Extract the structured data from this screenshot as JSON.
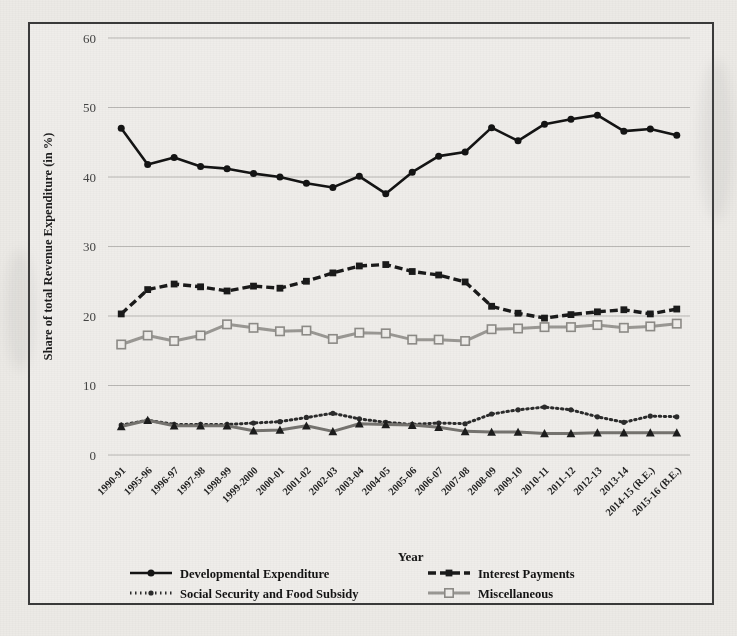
{
  "chart_data": {
    "type": "line",
    "title": "",
    "xlabel": "Year",
    "ylabel": "Share of total Revenue Expenditure (in %)",
    "ylim": [
      0,
      60
    ],
    "yticks": [
      0,
      10,
      20,
      30,
      40,
      50,
      60
    ],
    "grid": true,
    "legend_position": "bottom",
    "categories": [
      "1990-91",
      "1995-96",
      "1996-97",
      "1997-98",
      "1998-99",
      "1999-2000",
      "2000-01",
      "2001-02",
      "2002-03",
      "2003-04",
      "2004-05",
      "2005-06",
      "2006-07",
      "2007-08",
      "2008-09",
      "2009-10",
      "2010-11",
      "2011-12",
      "2012-13",
      "2013-14",
      "2014-15 (R.E.)",
      "2015-16 (B.E.)"
    ],
    "series": [
      {
        "name": "Developmental Expenditure",
        "color": "#141414",
        "marker": "circle",
        "line_style": "solid",
        "values": [
          47.0,
          41.8,
          42.8,
          41.5,
          41.2,
          40.5,
          40.0,
          39.1,
          38.5,
          40.1,
          37.6,
          40.7,
          43.0,
          43.6,
          47.1,
          45.2,
          47.6,
          48.3,
          48.9,
          46.6,
          46.9,
          46.0
        ]
      },
      {
        "name": "Interest Payments",
        "color": "#1a1a1a",
        "marker": "dash-square",
        "line_style": "dashed",
        "values": [
          20.3,
          23.8,
          24.6,
          24.2,
          23.6,
          24.3,
          24.0,
          25.0,
          26.2,
          27.2,
          27.4,
          26.4,
          25.9,
          24.9,
          21.4,
          20.4,
          19.7,
          20.2,
          20.6,
          20.9,
          20.3,
          21.0
        ]
      },
      {
        "name": "Social Security and Food Subsidy",
        "color": "#2b2b2b",
        "marker": "dotted",
        "line_style": "dotted",
        "values": [
          4.3,
          5.0,
          4.4,
          4.4,
          4.4,
          4.6,
          4.8,
          5.4,
          6.0,
          5.2,
          4.7,
          4.4,
          4.6,
          4.5,
          5.9,
          6.5,
          6.9,
          6.5,
          5.5,
          4.7,
          5.6,
          5.5
        ]
      },
      {
        "name": "Miscellaneous",
        "color": "#9a9894",
        "marker": "open-square",
        "line_style": "solid-light",
        "values": [
          15.9,
          17.2,
          16.4,
          17.2,
          18.8,
          18.3,
          17.8,
          17.9,
          16.7,
          17.6,
          17.5,
          16.6,
          16.6,
          16.4,
          18.1,
          18.2,
          18.4,
          18.4,
          18.7,
          18.3,
          18.5,
          18.9
        ]
      },
      {
        "name": "Others",
        "color": "#75736f",
        "marker": "triangle",
        "line_style": "solid-gray",
        "values": [
          4.1,
          5.0,
          4.2,
          4.2,
          4.2,
          3.5,
          3.6,
          4.2,
          3.4,
          4.5,
          4.4,
          4.3,
          4.0,
          3.4,
          3.3,
          3.3,
          3.1,
          3.1,
          3.2,
          3.2,
          3.2,
          3.2
        ]
      }
    ]
  },
  "legend": {
    "items": [
      {
        "label": "Developmental Expenditure",
        "key": "developmental-expenditure"
      },
      {
        "label": "Interest Payments",
        "key": "interest-payments"
      },
      {
        "label": "Social Security and Food Subsidy",
        "key": "social-security-and-food-subsidy"
      },
      {
        "label": "Miscellaneous",
        "key": "miscellaneous"
      },
      {
        "label": "Others",
        "key": "others"
      }
    ]
  },
  "axes": {
    "x_title": "Year",
    "y_title": "Share of total Revenue Expenditure (in %)"
  },
  "caption": ""
}
